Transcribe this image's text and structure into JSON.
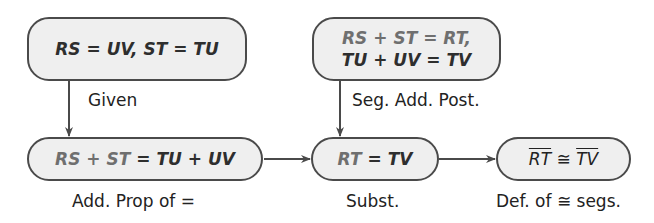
{
  "diagram": {
    "type": "flow-proof",
    "nodes": [
      {
        "id": "given",
        "parts": [
          {
            "t": "RS = UV, ST = TU",
            "c": "d"
          }
        ],
        "reason": "Given"
      },
      {
        "id": "seg-add",
        "line1": [
          {
            "t": "RS + ST = RT,",
            "c": "g"
          }
        ],
        "line2": [
          {
            "t": "TU + UV = TV",
            "c": "d"
          }
        ],
        "reason": "Seg. Add. Post."
      },
      {
        "id": "add-prop",
        "parts": [
          {
            "t": "RS + ST",
            "c": "g"
          },
          {
            "t": " = TU + UV",
            "c": "d"
          }
        ],
        "reason": "Add. Prop of ="
      },
      {
        "id": "subst",
        "parts": [
          {
            "t": "RT",
            "c": "g"
          },
          {
            "t": " = TV",
            "c": "d"
          }
        ],
        "reason": "Subst."
      },
      {
        "id": "conclusion",
        "seg1": "RT",
        "symbol": " ≅ ",
        "seg2": "TV",
        "reason": "Def. of ≅ segs."
      }
    ],
    "edges": [
      {
        "from": "given",
        "to": "add-prop"
      },
      {
        "from": "seg-add",
        "to": "subst"
      },
      {
        "from": "add-prop",
        "to": "subst"
      },
      {
        "from": "subst",
        "to": "conclusion"
      }
    ]
  }
}
